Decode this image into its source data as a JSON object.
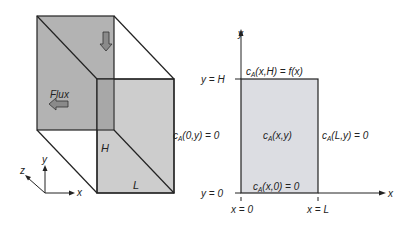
{
  "left_figure": {
    "flux_label": "Flux",
    "height_label": "H",
    "length_label": "L",
    "axes": {
      "x": "x",
      "y": "y",
      "z": "z"
    }
  },
  "right_figure": {
    "axis_y": "y",
    "axis_x": "x",
    "top_tick": "y = H",
    "bottom_tick": "y = 0",
    "left_tick": "x = 0",
    "right_tick": "x = L",
    "bc_top": {
      "c": "c",
      "sub": "A",
      "args": "(x,H) = f(x)"
    },
    "bc_left": {
      "c": "c",
      "sub": "A",
      "args": "(0,y) = 0"
    },
    "bc_right": {
      "c": "c",
      "sub": "A",
      "args": "(L,y) = 0"
    },
    "bc_bottom": {
      "c": "c",
      "sub": "A",
      "args": "(x,0) = 0"
    },
    "interior": {
      "c": "c",
      "sub": "A",
      "args": "(x,y)"
    }
  },
  "colors": {
    "face": "#b3b3b3",
    "front_face": "#c4c4c4",
    "rect_fill": "#dcdde2",
    "line": "#222222",
    "arrow_fill": "#8a8a8a"
  }
}
